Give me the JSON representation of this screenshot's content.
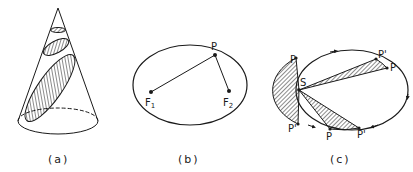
{
  "figure": {
    "panels": [
      {
        "id": "a",
        "caption": "(a)",
        "description": "Cone cut by planes producing conic sections (circle, ellipse, ellipse)"
      },
      {
        "id": "b",
        "caption": "(b)",
        "description": "Ellipse with foci and point on curve",
        "labels": {
          "point": "P",
          "focus1": "F",
          "focus1_sub": "1",
          "focus2": "F",
          "focus2_sub": "2"
        }
      },
      {
        "id": "c",
        "caption": "(c)",
        "description": "Orbital ellipse with equal-area sectors swept from focus S",
        "labels": {
          "focus": "S",
          "p_top_left": "P",
          "p_prime_bottom_left": "P'",
          "p_prime_top_right": "P'",
          "p_right": "P",
          "p_bottom": "P",
          "p_prime_bottom": "P'"
        }
      }
    ],
    "colors": {
      "stroke": "#1a1a1a",
      "background": "#ffffff"
    }
  }
}
